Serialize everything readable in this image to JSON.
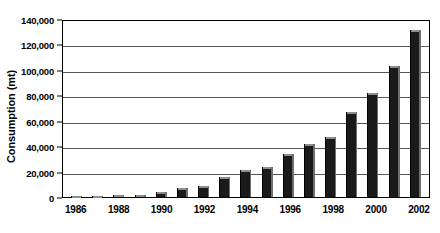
{
  "chart_data": {
    "type": "bar",
    "title": "",
    "subtitle": "",
    "xlabel": "",
    "ylabel": "Consumption (mt)",
    "ylim": [
      0,
      140000
    ],
    "ytick_step": 20000,
    "ytick_labels": [
      "140,000",
      "120,000",
      "100,000",
      "80,000",
      "60,000",
      "40,000",
      "20,000",
      "0"
    ],
    "ytick_values": [
      140000,
      120000,
      100000,
      80000,
      60000,
      40000,
      20000,
      0
    ],
    "grid": "horizontal",
    "legend": "none",
    "bar_color": "#1a1a1a",
    "categories": [
      "1986",
      "1987",
      "1988",
      "1989",
      "1990",
      "1991",
      "1992",
      "1993",
      "1994",
      "1995",
      "1996",
      "1997",
      "1998",
      "1999",
      "2000",
      "2001",
      "2002"
    ],
    "visible_xtick_labels": [
      "1986",
      "",
      "1988",
      "",
      "1990",
      "",
      "1992",
      "",
      "1994",
      "",
      "1996",
      "",
      "1998",
      "",
      "2000",
      "",
      "2002"
    ],
    "values": [
      200,
      400,
      1200,
      1800,
      4000,
      7000,
      9000,
      16000,
      21000,
      24000,
      34000,
      42000,
      47000,
      67000,
      82000,
      103000,
      131000
    ],
    "series": [
      {
        "name": "Consumption",
        "values": [
          200,
          400,
          1200,
          1800,
          4000,
          7000,
          9000,
          16000,
          21000,
          24000,
          34000,
          42000,
          47000,
          67000,
          82000,
          103000,
          131000
        ]
      }
    ]
  }
}
